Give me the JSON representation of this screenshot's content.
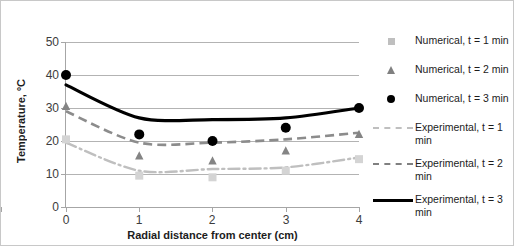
{
  "chart_data": {
    "type": "line",
    "title": "",
    "xlabel": "Radial distance from center (cm)",
    "ylabel": "Temperature, ºC",
    "xlim": [
      0,
      4
    ],
    "ylim": [
      0,
      50
    ],
    "xticks": [
      "0",
      "1",
      "2",
      "3",
      "4"
    ],
    "yticks": [
      "0",
      "10",
      "20",
      "30",
      "40",
      "50"
    ],
    "grid": true,
    "legend_position": "right",
    "x": [
      0,
      1,
      2,
      3,
      4
    ],
    "series": [
      {
        "name": "Numerical, t = 1 min",
        "marker": "square",
        "color": "#bfbfbf",
        "style": "markers",
        "values": [
          20.5,
          9.5,
          9.0,
          11.0,
          14.5
        ]
      },
      {
        "name": "Numerical, t = 2 min",
        "marker": "triangle",
        "color": "#808080",
        "style": "markers",
        "values": [
          30.5,
          15.5,
          14.0,
          17.0,
          22.0
        ]
      },
      {
        "name": "Numerical, t = 3 min",
        "marker": "circle",
        "color": "#000000",
        "style": "markers",
        "values": [
          40.0,
          22.0,
          20.0,
          24.0,
          30.0
        ]
      },
      {
        "name": "Experimental, t = 1 min",
        "marker": "none",
        "color": "#bfbfbf",
        "style": "dash-dot-line",
        "values": [
          19.5,
          11.0,
          11.5,
          12.0,
          15.0
        ]
      },
      {
        "name": "Experimental, t = 2 min",
        "marker": "none",
        "color": "#808080",
        "style": "dashed-line",
        "values": [
          29.0,
          19.5,
          19.5,
          20.5,
          22.5
        ]
      },
      {
        "name": "Experimental, t = 3 min",
        "marker": "none",
        "color": "#000000",
        "style": "solid-line",
        "values": [
          37.0,
          27.0,
          26.5,
          27.0,
          30.0
        ]
      }
    ]
  },
  "axes": {
    "y_title": "Temperature, ºC",
    "x_title": "Radial distance from center (cm)",
    "y_ticks": [
      "50",
      "40",
      "30",
      "20",
      "10",
      "0"
    ],
    "x_ticks": [
      "0",
      "1",
      "2",
      "3",
      "4"
    ]
  },
  "legend": {
    "entries": [
      {
        "label": "Numerical, t = 1 min",
        "key": "square-marker"
      },
      {
        "label": "Numerical, t = 2 min",
        "key": "triangle-marker"
      },
      {
        "label": "Numerical, t = 3 min",
        "key": "circle-marker"
      },
      {
        "label": "Experimental, t = 1 min",
        "key": "dash-dot-line"
      },
      {
        "label": "Experimental, t = 2 min",
        "key": "dashed-line"
      },
      {
        "label": "Experimental, t = 3 min",
        "key": "solid-line"
      }
    ]
  },
  "colors": {
    "light_gray": "#bfbfbf",
    "mid_gray": "#808080",
    "black": "#000000",
    "grid": "#b3b3b3",
    "axis": "#a6a6a6",
    "text": "#1c1c1c"
  }
}
